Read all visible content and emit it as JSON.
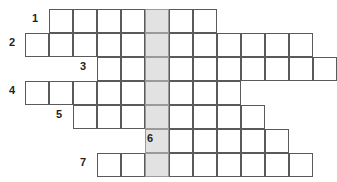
{
  "puzzle": {
    "type": "crossword-skeleton",
    "title": "",
    "cell_size": 24,
    "grid_origin_x": 25,
    "grid_origin_y": 9,
    "shaded_column_index": 5,
    "shaded_color": "#e2e2e2",
    "cell_border_color": "#5a5a5a",
    "background_color": "#ffffff",
    "rows": [
      {
        "number": "1",
        "start_col": 1,
        "length": 7,
        "number_x": 32,
        "number_y": 13
      },
      {
        "number": "2",
        "start_col": 0,
        "length": 12,
        "number_x": 9,
        "number_y": 37
      },
      {
        "number": "3",
        "start_col": 3,
        "length": 10,
        "number_x": 80,
        "number_y": 61
      },
      {
        "number": "4",
        "start_col": 0,
        "length": 9,
        "number_x": 9,
        "number_y": 85
      },
      {
        "number": "5",
        "start_col": 2,
        "length": 8,
        "number_x": 56,
        "number_y": 109
      },
      {
        "number": "6",
        "start_col": 5,
        "length": 6,
        "number_x": 147,
        "number_y": 133
      },
      {
        "number": "7",
        "start_col": 3,
        "length": 9,
        "number_x": 80,
        "number_y": 157
      }
    ],
    "row_count": 7,
    "total_columns": 13
  }
}
